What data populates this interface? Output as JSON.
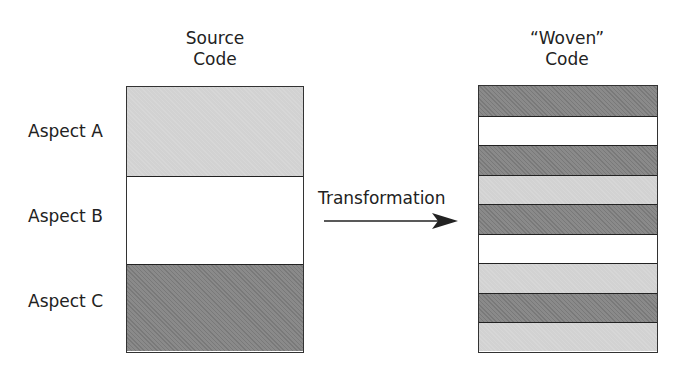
{
  "source": {
    "title_line1": "Source",
    "title_line2": "Code",
    "segments": [
      {
        "label": "Aspect A",
        "shade": "light"
      },
      {
        "label": "Aspect B",
        "shade": "white"
      },
      {
        "label": "Aspect C",
        "shade": "dark"
      }
    ]
  },
  "transformation": {
    "label": "Transformation"
  },
  "woven": {
    "title_line1": "“Woven”",
    "title_line2": "Code",
    "stripes": [
      "dark",
      "white",
      "dark",
      "light",
      "dark",
      "white",
      "light",
      "dark",
      "light"
    ]
  },
  "colors": {
    "light": "#d2d2d2",
    "dark": "#8a8a8a",
    "white": "#ffffff",
    "outline": "#333333"
  }
}
